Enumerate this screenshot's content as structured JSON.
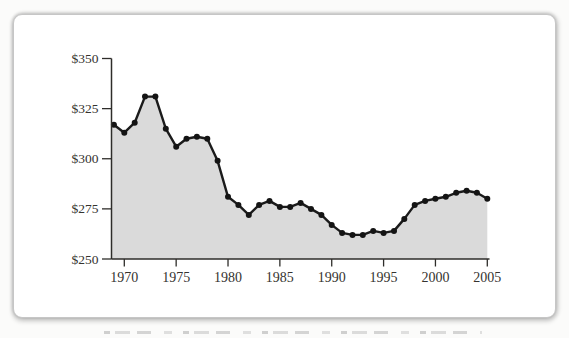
{
  "chart_data": {
    "type": "area",
    "title": "",
    "xlabel": "",
    "ylabel": "",
    "x": [
      1969,
      1970,
      1971,
      1972,
      1973,
      1974,
      1975,
      1976,
      1977,
      1978,
      1979,
      1980,
      1981,
      1982,
      1983,
      1984,
      1985,
      1986,
      1987,
      1988,
      1989,
      1990,
      1991,
      1992,
      1993,
      1994,
      1995,
      1996,
      1997,
      1998,
      1999,
      2000,
      2001,
      2002,
      2003,
      2004,
      2005
    ],
    "values": [
      317,
      313,
      318,
      331,
      331,
      315,
      306,
      310,
      311,
      310,
      299,
      281,
      277,
      272,
      277,
      279,
      276,
      276,
      278,
      275,
      272,
      267,
      263,
      262,
      262,
      264,
      263,
      264,
      270,
      277,
      279,
      280,
      281,
      283,
      284,
      283,
      280
    ],
    "ylim": [
      250,
      350
    ],
    "xlim": [
      1968.8,
      2005
    ],
    "y_ticks": [
      {
        "value": 350,
        "label": "$350"
      },
      {
        "value": 325,
        "label": "$325"
      },
      {
        "value": 300,
        "label": "$300"
      },
      {
        "value": 275,
        "label": "$275"
      },
      {
        "value": 250,
        "label": "$250"
      }
    ],
    "x_ticks": [
      {
        "value": 1970,
        "label": "1970"
      },
      {
        "value": 1975,
        "label": "1975"
      },
      {
        "value": 1980,
        "label": "1980"
      },
      {
        "value": 1985,
        "label": "1985"
      },
      {
        "value": 1990,
        "label": "1990"
      },
      {
        "value": 1995,
        "label": "1995"
      },
      {
        "value": 2000,
        "label": "2000"
      },
      {
        "value": 2005,
        "label": "2005"
      }
    ],
    "grid": false,
    "legend": "none",
    "marker": "circle",
    "colors": {
      "area_fill": "#dadada",
      "line": "#1b1b1b",
      "marker": "#141414",
      "axis": "#2e2d2a",
      "label": "#35332f"
    }
  }
}
